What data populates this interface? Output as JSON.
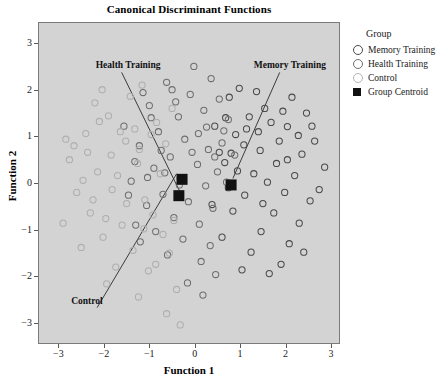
{
  "page": {
    "top_cut_text": "· · · · · · · · · · · ·"
  },
  "chart_data": {
    "type": "scatter",
    "title": "Canonical Discriminant Functions",
    "xlabel": "Function 1",
    "ylabel": "Function 2",
    "xlim": [
      -3.45,
      3.2
    ],
    "ylim": [
      -3.45,
      3.45
    ],
    "xticks": [
      -3,
      -2,
      -1,
      0,
      1,
      2,
      3
    ],
    "yticks": [
      -3,
      -2,
      -1,
      0,
      1,
      2,
      3
    ],
    "xtick_labels": [
      "−3",
      "−2",
      "−1",
      "0",
      "1",
      "2",
      "3"
    ],
    "ytick_labels": [
      "−3",
      "−2",
      "−1",
      "0",
      "1",
      "2",
      "3"
    ],
    "grid": false,
    "legend_position": "right",
    "plot_background": "#d3d3d3",
    "series": [
      {
        "name": "Memory Training",
        "marker": "open-circle",
        "color": "#4a4a4a",
        "points": [
          [
            0.96,
            2.05
          ],
          [
            1.52,
            1.62
          ],
          [
            2.02,
            1.23
          ],
          [
            1.18,
            1.44
          ],
          [
            0.74,
            1.86
          ],
          [
            1.84,
            0.92
          ],
          [
            2.34,
            0.64
          ],
          [
            1.42,
            0.72
          ],
          [
            0.88,
            1.06
          ],
          [
            1.66,
            1.32
          ],
          [
            2.18,
            0.18
          ],
          [
            1.28,
            0.22
          ],
          [
            0.64,
            0.46
          ],
          [
            1.96,
            -0.18
          ],
          [
            2.52,
            -0.36
          ],
          [
            1.08,
            -0.24
          ],
          [
            1.72,
            -0.62
          ],
          [
            2.28,
            -0.84
          ],
          [
            0.82,
            -0.58
          ],
          [
            1.44,
            -1.02
          ],
          [
            2.06,
            -1.28
          ],
          [
            0.58,
            -1.14
          ],
          [
            1.22,
            -1.46
          ],
          [
            1.88,
            -1.72
          ],
          [
            2.62,
            0.92
          ],
          [
            2.84,
            0.36
          ],
          [
            2.44,
            1.52
          ],
          [
            0.42,
            1.24
          ],
          [
            1.06,
            0.84
          ],
          [
            1.58,
            0.04
          ],
          [
            2.12,
            1.86
          ],
          [
            0.72,
            -0.08
          ],
          [
            1.34,
            1.98
          ],
          [
            2.72,
            -0.12
          ],
          [
            1.02,
            -1.84
          ],
          [
            0.52,
            0.68
          ],
          [
            1.78,
            0.44
          ],
          [
            2.26,
            1.04
          ],
          [
            1.48,
            -0.42
          ],
          [
            0.92,
            0.28
          ],
          [
            2.56,
            1.24
          ],
          [
            1.12,
            1.18
          ],
          [
            1.92,
            1.56
          ],
          [
            0.66,
            1.42
          ],
          [
            2.38,
            -1.46
          ],
          [
            1.62,
            -1.92
          ],
          [
            0.36,
            -0.44
          ],
          [
            2.02,
            0.52
          ],
          [
            1.38,
            1.12
          ],
          [
            0.78,
            0.66
          ]
        ]
      },
      {
        "name": "Health Training",
        "marker": "open-circle",
        "color": "#6e6e6e",
        "points": [
          [
            -0.64,
            2.18
          ],
          [
            -0.12,
            1.92
          ],
          [
            0.34,
            2.26
          ],
          [
            -1.02,
            1.68
          ],
          [
            -0.38,
            1.44
          ],
          [
            0.18,
            1.58
          ],
          [
            0.62,
            1.14
          ],
          [
            -0.82,
            1.12
          ],
          [
            -0.24,
            0.96
          ],
          [
            0.28,
            0.74
          ],
          [
            -1.24,
            0.82
          ],
          [
            -0.56,
            0.58
          ],
          [
            0.04,
            0.42
          ],
          [
            0.48,
            0.26
          ],
          [
            -0.92,
            0.34
          ],
          [
            -0.34,
            0.12
          ],
          [
            0.22,
            -0.04
          ],
          [
            -1.42,
            0.06
          ],
          [
            -0.72,
            -0.22
          ],
          [
            -0.16,
            -0.38
          ],
          [
            0.38,
            -0.52
          ],
          [
            -1.08,
            -0.46
          ],
          [
            -0.48,
            -0.72
          ],
          [
            0.08,
            -0.86
          ],
          [
            -0.88,
            -1.02
          ],
          [
            -0.28,
            -1.18
          ],
          [
            0.32,
            -1.32
          ],
          [
            -1.32,
            -0.88
          ],
          [
            -0.62,
            -1.52
          ],
          [
            0.12,
            -1.66
          ],
          [
            -1.58,
            1.24
          ],
          [
            -0.04,
            2.52
          ],
          [
            0.52,
            1.82
          ],
          [
            -1.16,
            1.96
          ],
          [
            0.68,
            0.04
          ],
          [
            -0.44,
            1.76
          ],
          [
            0.44,
            -1.94
          ],
          [
            -1.48,
            -0.24
          ],
          [
            -0.08,
            0.68
          ],
          [
            0.58,
            0.88
          ],
          [
            -0.98,
            1.42
          ],
          [
            -0.18,
            -2.12
          ],
          [
            0.72,
            1.38
          ],
          [
            -1.34,
            0.48
          ],
          [
            -0.52,
            2.02
          ],
          [
            0.24,
            1.22
          ],
          [
            -0.76,
            0.72
          ],
          [
            0.06,
            1.08
          ],
          [
            -1.22,
            -1.24
          ],
          [
            0.42,
            0.58
          ],
          [
            -0.36,
            -0.02
          ],
          [
            0.86,
            0.62
          ],
          [
            -0.68,
            0.24
          ],
          [
            0.16,
            -2.38
          ],
          [
            -1.06,
            0.14
          ]
        ]
      },
      {
        "name": "Control",
        "marker": "open-circle",
        "color": "#aeaeae",
        "points": [
          [
            -2.42,
            1.08
          ],
          [
            -1.92,
            1.46
          ],
          [
            -2.78,
            0.52
          ],
          [
            -1.54,
            0.92
          ],
          [
            -2.16,
            0.26
          ],
          [
            -1.28,
            0.44
          ],
          [
            -2.62,
            -0.18
          ],
          [
            -1.84,
            -0.12
          ],
          [
            -1.12,
            -0.34
          ],
          [
            -2.32,
            -0.62
          ],
          [
            -1.62,
            -0.88
          ],
          [
            -0.94,
            -0.66
          ],
          [
            -2.04,
            -1.14
          ],
          [
            -1.38,
            -1.42
          ],
          [
            -0.72,
            -1.08
          ],
          [
            -2.52,
            -1.36
          ],
          [
            -1.76,
            -1.78
          ],
          [
            -1.04,
            -1.86
          ],
          [
            -0.58,
            -1.48
          ],
          [
            -2.22,
            1.74
          ],
          [
            -1.44,
            1.88
          ],
          [
            -0.86,
            1.32
          ],
          [
            -2.86,
            0.96
          ],
          [
            -1.18,
            2.12
          ],
          [
            -0.42,
            -2.26
          ],
          [
            -1.96,
            -2.14
          ],
          [
            -1.26,
            -2.42
          ],
          [
            -2.68,
            0.82
          ],
          [
            -0.66,
            0.86
          ],
          [
            -1.72,
            0.18
          ],
          [
            -2.12,
            1.34
          ],
          [
            -0.98,
            1.06
          ],
          [
            -1.52,
            -0.42
          ],
          [
            -2.38,
            0.68
          ],
          [
            -0.78,
            0.22
          ],
          [
            -1.86,
            0.62
          ],
          [
            -2.92,
            -0.84
          ],
          [
            -1.14,
            -0.96
          ],
          [
            -0.48,
            -0.78
          ],
          [
            -2.26,
            -0.34
          ],
          [
            -1.34,
            1.18
          ],
          [
            -0.64,
            -2.78
          ],
          [
            -2.06,
            2.02
          ],
          [
            -1.66,
            1.12
          ],
          [
            -0.88,
            -1.72
          ],
          [
            -2.48,
            0.08
          ],
          [
            -1.24,
            0.74
          ],
          [
            -0.52,
            1.62
          ],
          [
            -1.98,
            -0.74
          ],
          [
            -0.34,
            -3.02
          ]
        ]
      }
    ],
    "centroids": {
      "name": "Group Centroid",
      "marker": "filled-square",
      "color": "#111111",
      "points": [
        [
          -0.3,
          0.1
        ],
        [
          -0.37,
          -0.25
        ],
        [
          0.78,
          -0.02
        ]
      ]
    },
    "annotations": [
      {
        "text": "Health Training",
        "label_x": -2.18,
        "label_y": 2.52,
        "line_to_x": -0.33,
        "line_to_y": -0.2
      },
      {
        "text": "Memory Training",
        "label_x": 1.3,
        "label_y": 2.52,
        "line_to_x": 0.82,
        "line_to_y": 0.12
      },
      {
        "text": "Control",
        "label_x": -2.72,
        "label_y": -2.52,
        "line_to_x": -0.42,
        "line_to_y": 0.22
      }
    ]
  },
  "legend": {
    "title": "Group",
    "items": [
      {
        "label": "Memory Training",
        "marker": "open-circle",
        "color": "#4a4a4a"
      },
      {
        "label": "Health Training",
        "marker": "open-circle",
        "color": "#6e6e6e"
      },
      {
        "label": "Control",
        "marker": "open-circle",
        "color": "#b4b4b4"
      },
      {
        "label": "Group Centroid",
        "marker": "filled-square",
        "color": "#111111"
      }
    ]
  }
}
